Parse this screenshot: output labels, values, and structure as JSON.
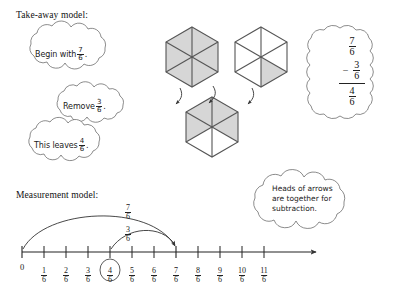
{
  "document": {
    "title": "Take-away and Measurement models for fraction subtraction"
  },
  "sections": {
    "takeaway": {
      "heading": "Take-away model:",
      "clouds": [
        {
          "id": "begin",
          "text_before": "Begin with",
          "fraction": {
            "num": "7",
            "den": "6"
          },
          "text_after": "."
        },
        {
          "id": "remove",
          "text_before": "Remove",
          "fraction": {
            "num": "3",
            "den": "6"
          },
          "text_after": "."
        },
        {
          "id": "leaves",
          "text_before": "This leaves",
          "fraction": {
            "num": "4",
            "den": "6"
          },
          "text_after": "."
        }
      ]
    },
    "measurement": {
      "heading": "Measurement model:"
    }
  },
  "hexagons": [
    {
      "id": "hex-start-full",
      "shaded": 6,
      "total": 6,
      "label": "6/6"
    },
    {
      "id": "hex-start-extra",
      "shaded": 1,
      "total": 6,
      "label": "1/6"
    },
    {
      "id": "hex-result",
      "shaded": 4,
      "total": 6,
      "label": "4/6"
    }
  ],
  "vertical_subtraction": {
    "minuend": {
      "num": "7",
      "den": "6"
    },
    "operator": "−",
    "subtrahend": {
      "num": "3",
      "den": "6"
    },
    "difference": {
      "num": "4",
      "den": "6"
    }
  },
  "callout": {
    "lines": [
      "Heads of arrows",
      "are together for",
      "subtraction."
    ]
  },
  "number_line": {
    "zero_label": "0",
    "ticks": [
      {
        "num": "1",
        "den": "6",
        "circled": false
      },
      {
        "num": "2",
        "den": "6",
        "circled": false
      },
      {
        "num": "3",
        "den": "6",
        "circled": false
      },
      {
        "num": "4",
        "den": "6",
        "circled": true
      },
      {
        "num": "5",
        "den": "6",
        "circled": false
      },
      {
        "num": "6",
        "den": "6",
        "circled": false
      },
      {
        "num": "7",
        "den": "6",
        "circled": false
      },
      {
        "num": "8",
        "den": "6",
        "circled": false
      },
      {
        "num": "9",
        "den": "6",
        "circled": false
      },
      {
        "num": "10",
        "den": "6",
        "circled": false
      },
      {
        "num": "11",
        "den": "6",
        "circled": false
      }
    ],
    "arcs": [
      {
        "id": "arc-total",
        "label": {
          "num": "7",
          "den": "6"
        },
        "from": "0",
        "to": "7/6"
      },
      {
        "id": "arc-removed",
        "label": {
          "num": "3",
          "den": "6"
        },
        "from": "4/6",
        "to": "7/6"
      }
    ]
  },
  "colors": {
    "ink": "#222222",
    "shade": "#d6d6d6",
    "hex_stroke": "#555555",
    "background": "#ffffff"
  }
}
